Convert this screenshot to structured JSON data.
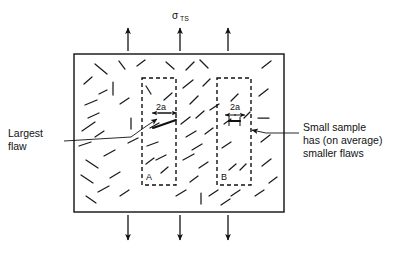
{
  "figure": {
    "title_label": "σ",
    "title_subscript": "TS",
    "applied_stress_name": "sigma-TS",
    "background_color": "#ffffff",
    "ink_color": "#111111"
  },
  "annotations": {
    "left": {
      "name": "largest-flaw-callout",
      "lines": [
        "Largest",
        "flaw"
      ],
      "line1": "Largest",
      "line2": "flaw"
    },
    "right": {
      "name": "small-sample-callout",
      "lines": [
        "Small sample",
        "has (on average)",
        "smaller flaws"
      ],
      "line1": "Small sample",
      "line2": "has (on average)",
      "line3": "smaller flaws"
    }
  },
  "samples": [
    {
      "id": "A",
      "label": "A",
      "dimension_label": "2a",
      "note": "large flaw sample"
    },
    {
      "id": "B",
      "label": "B",
      "dimension_label": "2a",
      "note": "small flaw sample"
    }
  ],
  "dimensions": {
    "box_a_2a": "2a",
    "box_b_2a": "2a"
  },
  "load_arrows": {
    "top_count": 3,
    "bottom_count": 3
  },
  "geometry": {
    "outer_rect": {
      "x": 74,
      "y": 54,
      "w": 210,
      "h": 158
    },
    "box_a": {
      "x": 142,
      "y": 78,
      "w": 34,
      "h": 107
    },
    "box_b": {
      "x": 217,
      "y": 78,
      "w": 34,
      "h": 107
    }
  },
  "flaws": {
    "outside_segments": [
      [
        95,
        64,
        107,
        74
      ],
      [
        119,
        61,
        125,
        69
      ],
      [
        84,
        84,
        92,
        77
      ],
      [
        99,
        94,
        107,
        90
      ],
      [
        113,
        82,
        113,
        95
      ],
      [
        85,
        105,
        97,
        100
      ],
      [
        88,
        118,
        99,
        113
      ],
      [
        82,
        131,
        95,
        122
      ],
      [
        120,
        104,
        129,
        98
      ],
      [
        131,
        118,
        131,
        129
      ],
      [
        79,
        146,
        91,
        142
      ],
      [
        95,
        137,
        104,
        131
      ],
      [
        86,
        160,
        98,
        168
      ],
      [
        104,
        156,
        115,
        150
      ],
      [
        81,
        175,
        93,
        183
      ],
      [
        110,
        178,
        120,
        172
      ],
      [
        98,
        192,
        109,
        186
      ],
      [
        120,
        196,
        129,
        190
      ],
      [
        86,
        196,
        96,
        203
      ],
      [
        128,
        143,
        138,
        138
      ],
      [
        186,
        70,
        194,
        62
      ],
      [
        183,
        88,
        193,
        80
      ],
      [
        190,
        104,
        198,
        96
      ],
      [
        196,
        118,
        204,
        111
      ],
      [
        181,
        124,
        190,
        117
      ],
      [
        186,
        137,
        196,
        131
      ],
      [
        192,
        150,
        202,
        144
      ],
      [
        183,
        160,
        194,
        154
      ],
      [
        199,
        168,
        208,
        162
      ],
      [
        190,
        182,
        198,
        176
      ],
      [
        203,
        86,
        210,
        79
      ],
      [
        205,
        134,
        213,
        128
      ],
      [
        201,
        193,
        201,
        204
      ],
      [
        209,
        196,
        218,
        190
      ],
      [
        176,
        196,
        186,
        190
      ],
      [
        262,
        68,
        271,
        61
      ],
      [
        259,
        96,
        268,
        89
      ],
      [
        258,
        118,
        269,
        118
      ],
      [
        261,
        142,
        270,
        135
      ],
      [
        262,
        166,
        271,
        159
      ],
      [
        269,
        183,
        277,
        177
      ],
      [
        255,
        196,
        264,
        190
      ],
      [
        200,
        60,
        208,
        68
      ],
      [
        137,
        66,
        145,
        60
      ],
      [
        166,
        62,
        174,
        69
      ],
      [
        210,
        110,
        219,
        104
      ],
      [
        231,
        196,
        240,
        190
      ],
      [
        221,
        205,
        230,
        199
      ]
    ],
    "box_a_segments": [
      [
        146,
        86,
        151,
        94
      ],
      [
        150,
        128,
        159,
        123
      ],
      [
        147,
        146,
        158,
        142
      ],
      [
        156,
        160,
        166,
        155
      ],
      [
        164,
        100,
        172,
        93
      ],
      [
        161,
        173,
        168,
        167
      ],
      [
        146,
        164,
        154,
        158
      ]
    ],
    "box_b_segments": [
      [
        231,
        101,
        238,
        94
      ],
      [
        222,
        148,
        231,
        142
      ],
      [
        229,
        170,
        236,
        164
      ],
      [
        240,
        170,
        246,
        164
      ],
      [
        244,
        118,
        250,
        112
      ],
      [
        224,
        124,
        231,
        119
      ]
    ],
    "large_flaw": [
      153,
      128,
      176,
      120
    ]
  }
}
